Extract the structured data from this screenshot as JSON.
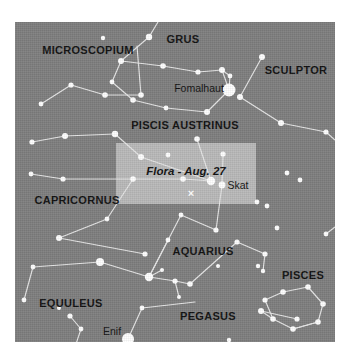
{
  "figure": {
    "type": "sky-chart",
    "colors": {
      "sky_background": "#7e7e7e",
      "highlight_box": "#b9b9b9",
      "star": "#ffffff",
      "constellation_line": "#e6e6e6",
      "label_text": "#111111",
      "page_background": "#ffffff"
    }
  },
  "highlight": {
    "name": "flora-highlight-box",
    "x": 101,
    "y": 121,
    "width": 140,
    "height": 61,
    "object_label": "Flora - Aug. 27",
    "object_label_x": 70,
    "object_label_y": 28,
    "marker_glyph": "×",
    "marker_x": 75,
    "marker_y": 50
  },
  "constellation_labels": [
    {
      "name": "label-microscopium",
      "text": "MICROSCOPIUM",
      "x": 73,
      "y": 28
    },
    {
      "name": "label-grus",
      "text": "GRUS",
      "x": 168,
      "y": 17
    },
    {
      "name": "label-sculptor",
      "text": "SCULPTOR",
      "x": 281,
      "y": 48
    },
    {
      "name": "label-piscis-austrinus",
      "text": "PISCIS AUSTRINUS",
      "x": 170,
      "y": 103
    },
    {
      "name": "label-capricornus",
      "text": "CAPRICORNUS",
      "x": 62,
      "y": 178
    },
    {
      "name": "label-aquarius",
      "text": "AQUARIUS",
      "x": 188,
      "y": 229
    },
    {
      "name": "label-pisces",
      "text": "PISCES",
      "x": 288,
      "y": 253
    },
    {
      "name": "label-equuleus",
      "text": "EQUULEUS",
      "x": 56,
      "y": 281
    },
    {
      "name": "label-pegasus",
      "text": "PEGASUS",
      "x": 193,
      "y": 294
    }
  ],
  "star_labels": [
    {
      "name": "label-fomalhaut",
      "text": "Fomalhaut",
      "x": 184,
      "y": 66
    },
    {
      "name": "label-skat",
      "text": "Skat",
      "x": 223,
      "y": 163
    },
    {
      "name": "label-enif",
      "text": "Enif",
      "x": 97,
      "y": 309
    }
  ],
  "chart_data": {
    "type": "scatter",
    "xlabel": "",
    "ylabel": "",
    "xlim": [
      0,
      320
    ],
    "ylim": [
      0,
      320
    ],
    "grid": false,
    "legend": "none",
    "stars": [
      {
        "id": "fomalhaut",
        "x": 214,
        "y": 68,
        "r": 6.5,
        "label": "Fomalhaut"
      },
      {
        "id": "enif",
        "x": 113,
        "y": 317,
        "r": 6.0,
        "label": "Enif"
      },
      {
        "id": "skat",
        "x": 207,
        "y": 163,
        "r": 3.4,
        "label": "Skat"
      },
      {
        "id": "pa1",
        "x": 106,
        "y": 39,
        "r": 3.0
      },
      {
        "id": "pa2",
        "x": 148,
        "y": 44,
        "r": 2.8
      },
      {
        "id": "pa3",
        "x": 183,
        "y": 50,
        "r": 2.6
      },
      {
        "id": "pa4",
        "x": 207,
        "y": 48,
        "r": 3.0
      },
      {
        "id": "pa5",
        "x": 215,
        "y": 54,
        "r": 2.4
      },
      {
        "id": "pa6",
        "x": 97,
        "y": 60,
        "r": 2.4
      },
      {
        "id": "pa7",
        "x": 118,
        "y": 78,
        "r": 2.8
      },
      {
        "id": "pa8",
        "x": 151,
        "y": 86,
        "r": 2.4
      },
      {
        "id": "pa9",
        "x": 192,
        "y": 90,
        "r": 3.0
      },
      {
        "id": "grus1",
        "x": 134,
        "y": 15,
        "r": 3.2
      },
      {
        "id": "mic1",
        "x": 56,
        "y": 63,
        "r": 2.6
      },
      {
        "id": "mic2",
        "x": 90,
        "y": 73,
        "r": 2.8
      },
      {
        "id": "mic3",
        "x": 126,
        "y": 73,
        "r": 2.8
      },
      {
        "id": "mic4",
        "x": 26,
        "y": 82,
        "r": 2.4
      },
      {
        "id": "mic5",
        "x": 17,
        "y": 120,
        "r": 2.6
      },
      {
        "id": "scu1",
        "x": 247,
        "y": 35,
        "r": 3.0
      },
      {
        "id": "scu2",
        "x": 225,
        "y": 75,
        "r": 3.0
      },
      {
        "id": "scu3",
        "x": 266,
        "y": 101,
        "r": 3.0
      },
      {
        "id": "scu4",
        "x": 311,
        "y": 110,
        "r": 2.6
      },
      {
        "id": "cap1",
        "x": 50,
        "y": 114,
        "r": 3.0
      },
      {
        "id": "cap2",
        "x": 100,
        "y": 112,
        "r": 3.2
      },
      {
        "id": "cap3",
        "x": 126,
        "y": 135,
        "r": 3.0
      },
      {
        "id": "cap4",
        "x": 118,
        "y": 157,
        "r": 2.8
      },
      {
        "id": "cap5",
        "x": 168,
        "y": 157,
        "r": 2.8
      },
      {
        "id": "cap6",
        "x": 196,
        "y": 159,
        "r": 4.2
      },
      {
        "id": "cap7",
        "x": 48,
        "y": 157,
        "r": 2.6
      },
      {
        "id": "cap8",
        "x": 16,
        "y": 152,
        "r": 2.4
      },
      {
        "id": "cap9",
        "x": 92,
        "y": 197,
        "r": 2.4
      },
      {
        "id": "cap10",
        "x": 44,
        "y": 216,
        "r": 3.0
      },
      {
        "id": "cap11",
        "x": 130,
        "y": 232,
        "r": 2.6
      },
      {
        "id": "aq1",
        "x": 182,
        "y": 117,
        "r": 2.8
      },
      {
        "id": "aq2",
        "x": 201,
        "y": 208,
        "r": 2.6
      },
      {
        "id": "aq3",
        "x": 166,
        "y": 193,
        "r": 2.4
      },
      {
        "id": "aq4",
        "x": 252,
        "y": 184,
        "r": 2.4
      },
      {
        "id": "aq5",
        "x": 242,
        "y": 180,
        "r": 2.4
      },
      {
        "id": "aq6",
        "x": 250,
        "y": 232,
        "r": 2.6
      },
      {
        "id": "aq7",
        "x": 222,
        "y": 220,
        "r": 2.6
      },
      {
        "id": "aq8",
        "x": 153,
        "y": 218,
        "r": 2.4
      },
      {
        "id": "aq9",
        "x": 134,
        "y": 255,
        "r": 4.2
      },
      {
        "id": "aq10",
        "x": 147,
        "y": 248,
        "r": 2.0
      },
      {
        "id": "aq11",
        "x": 160,
        "y": 259,
        "r": 2.6
      },
      {
        "id": "aq12",
        "x": 175,
        "y": 262,
        "r": 2.8
      },
      {
        "id": "aq13",
        "x": 164,
        "y": 275,
        "r": 2.0
      },
      {
        "id": "aq14",
        "x": 85,
        "y": 240,
        "r": 4.0
      },
      {
        "id": "aq15",
        "x": 18,
        "y": 245,
        "r": 2.4
      },
      {
        "id": "aq16",
        "x": 9,
        "y": 278,
        "r": 2.4
      },
      {
        "id": "peg1",
        "x": 127,
        "y": 286,
        "r": 2.4
      },
      {
        "id": "peg2",
        "x": 246,
        "y": 289,
        "r": 3.0
      },
      {
        "id": "peg3",
        "x": 282,
        "y": 297,
        "r": 2.6
      },
      {
        "id": "equ1",
        "x": 55,
        "y": 294,
        "r": 2.6
      },
      {
        "id": "equ2",
        "x": 66,
        "y": 307,
        "r": 2.4
      },
      {
        "id": "equ3",
        "x": 50,
        "y": 329,
        "r": 2.4
      },
      {
        "id": "equ4",
        "x": 58,
        "y": 331,
        "r": 2.2
      },
      {
        "id": "pi1",
        "x": 268,
        "y": 270,
        "r": 2.8
      },
      {
        "id": "pi2",
        "x": 293,
        "y": 265,
        "r": 2.8
      },
      {
        "id": "pi3",
        "x": 308,
        "y": 282,
        "r": 2.8
      },
      {
        "id": "pi4",
        "x": 303,
        "y": 300,
        "r": 2.8
      },
      {
        "id": "pi5",
        "x": 278,
        "y": 307,
        "r": 2.8
      },
      {
        "id": "pi6",
        "x": 258,
        "y": 297,
        "r": 2.8
      },
      {
        "id": "pi7",
        "x": 250,
        "y": 278,
        "r": 2.6
      },
      {
        "id": "pi8",
        "x": 248,
        "y": 249,
        "r": 2.2
      },
      {
        "id": "pi9",
        "x": 243,
        "y": 244,
        "r": 2.2
      },
      {
        "id": "misc1",
        "x": 311,
        "y": 212,
        "r": 2.4
      },
      {
        "id": "misc2",
        "x": 285,
        "y": 158,
        "r": 2.4
      },
      {
        "id": "misc3",
        "x": 272,
        "y": 151,
        "r": 2.4
      },
      {
        "id": "misc4",
        "x": 262,
        "y": 206,
        "r": 2.4
      },
      {
        "id": "misc5",
        "x": 203,
        "y": 244,
        "r": 2.0
      },
      {
        "id": "misc6",
        "x": 88,
        "y": 16,
        "r": 2.2
      },
      {
        "id": "misc7",
        "x": 44,
        "y": 286,
        "r": 2.0
      },
      {
        "id": "misc8",
        "x": 214,
        "y": 318,
        "r": 2.2
      },
      {
        "id": "misc9",
        "x": 300,
        "y": 330,
        "r": 2.2
      },
      {
        "id": "misc10",
        "x": 153,
        "y": 133,
        "r": 2.4
      },
      {
        "id": "misc11",
        "x": 208,
        "y": 132,
        "r": 2.6
      }
    ],
    "lines": [
      {
        "id": "piscis-austrinus-loop",
        "points": [
          [
            106,
            39
          ],
          [
            148,
            44
          ],
          [
            183,
            50
          ],
          [
            207,
            48
          ],
          [
            214,
            68
          ],
          [
            192,
            90
          ],
          [
            151,
            86
          ],
          [
            118,
            78
          ],
          [
            97,
            60
          ],
          [
            106,
            39
          ]
        ]
      },
      {
        "id": "pa-to-fomalhaut-spur",
        "points": [
          [
            207,
            48
          ],
          [
            215,
            54
          ],
          [
            214,
            68
          ]
        ]
      },
      {
        "id": "grus-spur",
        "points": [
          [
            134,
            15
          ],
          [
            106,
            39
          ]
        ]
      },
      {
        "id": "grus-upper",
        "points": [
          [
            134,
            15
          ],
          [
            143,
            0
          ]
        ]
      },
      {
        "id": "microscopium-chain",
        "points": [
          [
            26,
            82
          ],
          [
            56,
            63
          ],
          [
            90,
            73
          ],
          [
            126,
            73
          ]
        ]
      },
      {
        "id": "microscopium-spur",
        "points": [
          [
            126,
            73
          ],
          [
            122,
            24
          ]
        ]
      },
      {
        "id": "mic-lower",
        "points": [
          [
            17,
            120
          ],
          [
            50,
            114
          ],
          [
            100,
            112
          ]
        ]
      },
      {
        "id": "sculptor-chain",
        "points": [
          [
            247,
            35
          ],
          [
            225,
            75
          ],
          [
            266,
            101
          ],
          [
            311,
            110
          ]
        ]
      },
      {
        "id": "capricornus-upper",
        "points": [
          [
            100,
            112
          ],
          [
            126,
            135
          ],
          [
            196,
            159
          ]
        ]
      },
      {
        "id": "capricornus-mid",
        "points": [
          [
            118,
            157
          ],
          [
            168,
            157
          ],
          [
            196,
            159
          ]
        ]
      },
      {
        "id": "capricornus-left",
        "points": [
          [
            16,
            152
          ],
          [
            48,
            157
          ],
          [
            118,
            157
          ]
        ]
      },
      {
        "id": "capricornus-lower",
        "points": [
          [
            44,
            216
          ],
          [
            92,
            197
          ],
          [
            118,
            157
          ]
        ]
      },
      {
        "id": "cap-to-aq",
        "points": [
          [
            44,
            216
          ],
          [
            130,
            232
          ]
        ]
      },
      {
        "id": "aquarius-spine",
        "points": [
          [
            182,
            117
          ],
          [
            196,
            159
          ]
        ]
      },
      {
        "id": "skat-chain",
        "points": [
          [
            208,
            132
          ],
          [
            207,
            163
          ],
          [
            201,
            208
          ]
        ]
      },
      {
        "id": "aq-lower-left",
        "points": [
          [
            201,
            208
          ],
          [
            166,
            193
          ],
          [
            134,
            255
          ]
        ]
      },
      {
        "id": "aq-water-jar",
        "points": [
          [
            153,
            218
          ],
          [
            134,
            255
          ],
          [
            160,
            259
          ],
          [
            175,
            262
          ]
        ]
      },
      {
        "id": "aq-jar-spur",
        "points": [
          [
            147,
            248
          ],
          [
            134,
            255
          ]
        ]
      },
      {
        "id": "aq-jar-down",
        "points": [
          [
            160,
            259
          ],
          [
            164,
            275
          ]
        ]
      },
      {
        "id": "aq-right-arm",
        "points": [
          [
            175,
            262
          ],
          [
            222,
            220
          ],
          [
            250,
            232
          ]
        ]
      },
      {
        "id": "aq-to-pisces",
        "points": [
          [
            250,
            232
          ],
          [
            248,
            249
          ]
        ]
      },
      {
        "id": "aq-left-arm",
        "points": [
          [
            85,
            240
          ],
          [
            134,
            255
          ]
        ]
      },
      {
        "id": "aq-far-left",
        "points": [
          [
            18,
            245
          ],
          [
            85,
            240
          ]
        ]
      },
      {
        "id": "aq-left-down",
        "points": [
          [
            18,
            245
          ],
          [
            9,
            278
          ]
        ]
      },
      {
        "id": "pegasus-enif",
        "points": [
          [
            113,
            317
          ],
          [
            127,
            286
          ],
          [
            180,
            280
          ]
        ]
      },
      {
        "id": "pegasus-right",
        "points": [
          [
            246,
            289
          ],
          [
            282,
            297
          ]
        ]
      },
      {
        "id": "pisces-circlet",
        "points": [
          [
            268,
            270
          ],
          [
            293,
            265
          ],
          [
            308,
            282
          ],
          [
            303,
            300
          ],
          [
            278,
            307
          ],
          [
            258,
            297
          ],
          [
            250,
            278
          ],
          [
            268,
            270
          ]
        ]
      },
      {
        "id": "pisces-tail",
        "points": [
          [
            278,
            307
          ],
          [
            303,
            300
          ]
        ]
      },
      {
        "id": "pisces-to-peg",
        "points": [
          [
            258,
            297
          ],
          [
            246,
            289
          ]
        ]
      },
      {
        "id": "equuleus-chain",
        "points": [
          [
            55,
            294
          ],
          [
            66,
            307
          ],
          [
            58,
            331
          ]
        ]
      },
      {
        "id": "equuleus-spur",
        "points": [
          [
            58,
            331
          ],
          [
            50,
            329
          ]
        ]
      },
      {
        "id": "top-right-spur",
        "points": [
          [
            311,
            110
          ],
          [
            320,
            118
          ]
        ]
      },
      {
        "id": "right-mid-spur",
        "points": [
          [
            311,
            212
          ],
          [
            320,
            205
          ]
        ]
      }
    ]
  }
}
